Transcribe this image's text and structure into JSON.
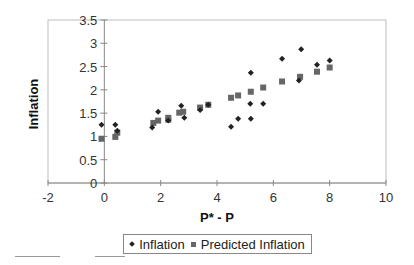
{
  "chart_data": {
    "type": "scatter",
    "title": "",
    "xlabel": "P* - P",
    "ylabel": "Inflation",
    "xlim": [
      -2,
      10
    ],
    "ylim": [
      0,
      3.5
    ],
    "x_ticks": [
      -2,
      0,
      2,
      4,
      6,
      8,
      10
    ],
    "y_ticks": [
      0,
      0.5,
      1,
      1.5,
      2,
      2.5,
      3,
      3.5
    ],
    "x_tick_labels": [
      "-2",
      "0",
      "2",
      "4",
      "6",
      "8",
      "10"
    ],
    "y_tick_labels": [
      "0",
      "0.5",
      "1",
      "1.5",
      "2",
      "2.5",
      "3",
      "3.5"
    ],
    "grid": false,
    "legend_position": "bottom",
    "series": [
      {
        "name": "Inflation",
        "marker": "diamond",
        "color": "#222222",
        "points": [
          [
            -0.1,
            1.25
          ],
          [
            0.39,
            1.25
          ],
          [
            0.46,
            1.12
          ],
          [
            1.7,
            1.19
          ],
          [
            1.91,
            1.53
          ],
          [
            2.27,
            1.34
          ],
          [
            2.73,
            1.66
          ],
          [
            2.84,
            1.4
          ],
          [
            3.4,
            1.57
          ],
          [
            3.69,
            1.68
          ],
          [
            4.5,
            1.21
          ],
          [
            4.75,
            1.38
          ],
          [
            5.2,
            1.38
          ],
          [
            5.2,
            2.37
          ],
          [
            5.18,
            1.7
          ],
          [
            5.64,
            1.7
          ],
          [
            6.31,
            2.67
          ],
          [
            6.99,
            2.87
          ],
          [
            6.91,
            2.2
          ],
          [
            7.55,
            2.54
          ],
          [
            8.0,
            2.63
          ]
        ]
      },
      {
        "name": "Predicted Inflation",
        "marker": "square",
        "color": "#666666",
        "points": [
          [
            -0.1,
            0.95
          ],
          [
            0.39,
            0.99
          ],
          [
            0.46,
            1.08
          ],
          [
            1.74,
            1.29
          ],
          [
            1.91,
            1.34
          ],
          [
            2.27,
            1.4
          ],
          [
            2.27,
            1.36
          ],
          [
            2.66,
            1.51
          ],
          [
            2.8,
            1.53
          ],
          [
            3.4,
            1.62
          ],
          [
            3.69,
            1.68
          ],
          [
            4.5,
            1.83
          ],
          [
            4.75,
            1.88
          ],
          [
            5.2,
            1.96
          ],
          [
            5.64,
            2.05
          ],
          [
            6.31,
            2.18
          ],
          [
            6.95,
            2.28
          ],
          [
            7.55,
            2.39
          ],
          [
            8.0,
            2.48
          ]
        ]
      }
    ]
  },
  "legend": {
    "items": [
      {
        "label": "Inflation",
        "icon": "diamond-marker-icon"
      },
      {
        "label": "Predicted Inflation",
        "icon": "square-marker-icon"
      }
    ]
  }
}
